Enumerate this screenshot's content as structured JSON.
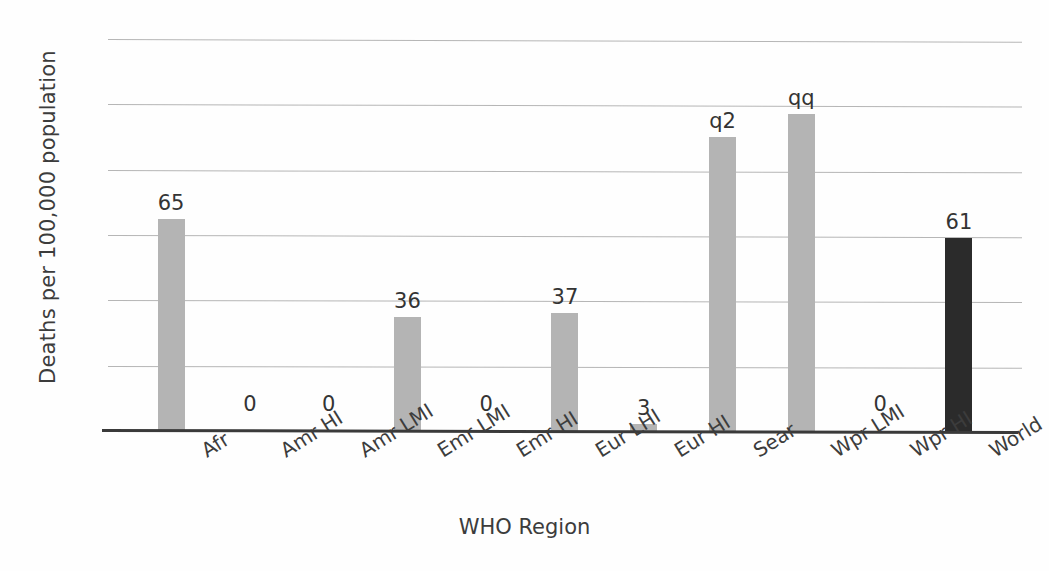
{
  "chart_data": {
    "type": "bar",
    "title": "",
    "xlabel": "WHO Region",
    "ylabel": "Deaths per 100,000 population",
    "categories": [
      "Afr",
      "Amr HI",
      "Amr LMI",
      "Emr LMI",
      "Emr HI",
      "Eur LHI",
      "Eur HI",
      "Sear",
      "Wpr LMI",
      "Wpr HI",
      "World"
    ],
    "values": [
      65,
      0,
      0,
      36,
      0,
      37,
      3,
      92,
      99,
      0,
      61
    ],
    "bar_heights": [
      65,
      0,
      0,
      35,
      0,
      36,
      2,
      90,
      97,
      0,
      59
    ],
    "data_labels": [
      "65",
      "0",
      "0",
      "36",
      "0",
      "37",
      "3",
      "q2",
      "qq",
      "0",
      "61"
    ],
    "ylim": [
      0,
      120
    ],
    "yticks": [
      0,
      20,
      40,
      60,
      80,
      100,
      120
    ],
    "ytick_labels": [
      "0",
      "20",
      "40",
      "60",
      "80",
      "100",
      "120"
    ],
    "grid": true,
    "legend": "none",
    "series": [
      {
        "name": "Deaths per 100,000 population",
        "values": [
          65,
          0,
          0,
          36,
          0,
          37,
          3,
          92,
          99,
          0,
          61
        ]
      }
    ],
    "colors": {
      "bar_default": "#b4b4b4",
      "bar_highlight": "#2b2b2b",
      "gridline": "#a9a9a9",
      "axis": "#3a3a3a",
      "text": "#3c3c3c",
      "background": "#fefefe"
    },
    "highlight_category": "World"
  }
}
